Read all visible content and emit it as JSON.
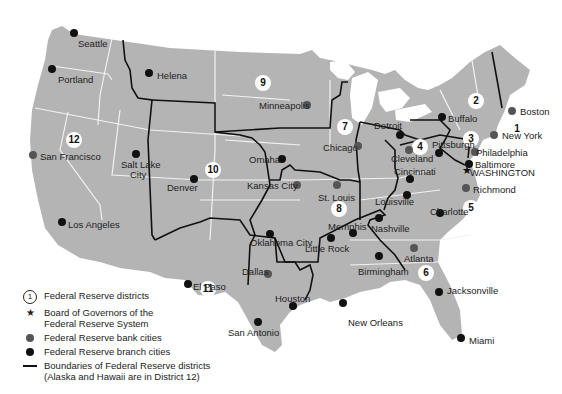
{
  "legend": {
    "district": {
      "symbol": "1",
      "label": "Federal Reserve districts"
    },
    "board": {
      "label": "Board of Governors of the Federal Reserve System"
    },
    "bank": {
      "label": "Federal Reserve bank cities"
    },
    "branch": {
      "label": "Federal Reserve branch cities"
    },
    "boundaries": {
      "label": "Boundaries of Federal Reserve districts",
      "note": "(Alaska and Hawaii are in District 12)"
    }
  },
  "districts": [
    "1",
    "2",
    "3",
    "4",
    "5",
    "6",
    "7",
    "8",
    "9",
    "10",
    "11",
    "12"
  ],
  "cities": {
    "seattle": "Seattle",
    "portland": "Portland",
    "helena": "Helena",
    "san_francisco": "San Francisco",
    "salt_lake_city_1": "Salt Lake",
    "salt_lake_city_2": "City",
    "los_angeles": "Los Angeles",
    "denver": "Denver",
    "minneapolis": "Minneapolis",
    "omaha": "Omaha",
    "kansas_city": "Kansas City",
    "oklahoma_city": "Oklahoma City",
    "el_paso": "El Paso",
    "dallas": "Dallas",
    "houston": "Houston",
    "san_antonio": "San Antonio",
    "chicago": "Chicago",
    "detroit": "Detroit",
    "st_louis": "St. Louis",
    "memphis": "Memphis",
    "little_rock": "Little Rock",
    "louisville": "Louisville",
    "nashville": "Nashville",
    "birmingham": "Birmingham",
    "new_orleans": "New Orleans",
    "atlanta": "Atlanta",
    "jacksonville": "Jacksonville",
    "miami": "Miami",
    "cleveland": "Cleveland",
    "cincinnati": "Cincinnati",
    "pittsburgh": "Pittsburgh",
    "buffalo": "Buffalo",
    "boston": "Boston",
    "new_york": "New York",
    "philadelphia": "Philadelphia",
    "baltimore": "Baltimore",
    "washington": "WASHINGTON",
    "richmond": "Richmond",
    "charlotte": "Charlotte"
  },
  "colors": {
    "land": "#b4b4b4",
    "boundary": "#111111",
    "state_line": "#f2f2f2",
    "bank_dot": "#555555",
    "branch_dot": "#111111"
  }
}
